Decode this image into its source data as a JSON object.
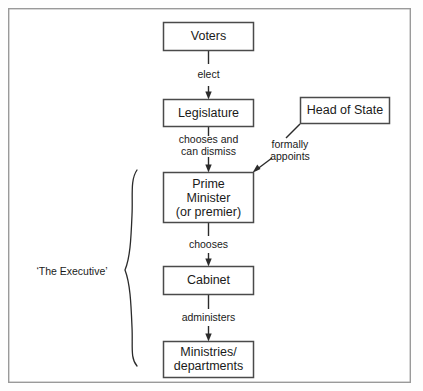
{
  "diagram": {
    "frame": {
      "x": 8,
      "y": 8,
      "width": 403,
      "height": 375
    },
    "colors": {
      "background": "#ffffff",
      "frame_stroke": "#9a9a9a",
      "box_stroke": "#4a4a4a",
      "connector": "#2b2b2b",
      "text": "#1a1a1a"
    },
    "nodes": [
      {
        "id": "voters",
        "label_lines": [
          "Voters"
        ],
        "x": 163,
        "y": 22,
        "width": 91,
        "height": 29
      },
      {
        "id": "legislature",
        "label_lines": [
          "Legislature"
        ],
        "x": 163,
        "y": 99,
        "width": 91,
        "height": 28
      },
      {
        "id": "head-of-state",
        "label_lines": [
          "Head of State"
        ],
        "x": 300,
        "y": 97,
        "width": 90,
        "height": 27
      },
      {
        "id": "prime-minister",
        "label_lines": [
          "Prime",
          "Minister",
          "(or premier)"
        ],
        "x": 163,
        "y": 172,
        "width": 91,
        "height": 51
      },
      {
        "id": "cabinet",
        "label_lines": [
          "Cabinet"
        ],
        "x": 163,
        "y": 266,
        "width": 91,
        "height": 29
      },
      {
        "id": "ministries",
        "label_lines": [
          "Ministries/",
          "departments"
        ],
        "x": 163,
        "y": 341,
        "width": 91,
        "height": 37
      }
    ],
    "edges": [
      {
        "id": "voters-legislature",
        "from": "voters",
        "to": "legislature",
        "label_lines": [
          "elect"
        ],
        "label_x": 209,
        "label_y": 75
      },
      {
        "id": "legislature-prime-minister",
        "from": "legislature",
        "to": "prime-minister",
        "label_lines": [
          "chooses and",
          "can dismiss"
        ],
        "label_x": 209,
        "label_y": 146
      },
      {
        "id": "head-of-state-prime-minister",
        "from": "head-of-state",
        "to": "prime-minister",
        "label_lines": [
          "formally",
          "appoints"
        ],
        "label_x": 289,
        "label_y": 150
      },
      {
        "id": "prime-minister-cabinet",
        "from": "prime-minister",
        "to": "cabinet",
        "label_lines": [
          "chooses"
        ],
        "label_x": 209,
        "label_y": 245
      },
      {
        "id": "cabinet-ministries",
        "from": "cabinet",
        "to": "ministries",
        "label_lines": [
          "administers"
        ],
        "label_x": 209,
        "label_y": 318
      }
    ],
    "group": {
      "id": "executive-group",
      "label": "‘The Executive’",
      "label_x": 72,
      "label_y": 272,
      "brace_top": 170,
      "brace_bottom": 366,
      "brace_x": 133,
      "brace_tip_x": 121,
      "brace_tip_y": 272,
      "members": [
        "prime-minister",
        "cabinet",
        "ministries"
      ]
    }
  }
}
